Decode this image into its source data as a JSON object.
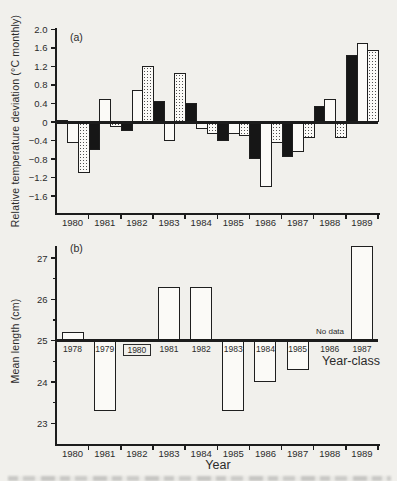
{
  "figure": {
    "panel_a_tag": "(a)",
    "panel_b_tag": "(b)",
    "paper_color": "#f1f0ec",
    "ink_color": "#1c1c1c"
  },
  "chart_data": [
    {
      "type": "bar",
      "panel": "a",
      "title": "",
      "ylabel": "Relative temperature deviation (°C monthly)",
      "xlabel": "",
      "ylim": [
        -2.05,
        2.05
      ],
      "grid": false,
      "ytick_values": [
        2.0,
        1.6,
        1.2,
        0.8,
        0.4,
        0,
        -0.4,
        -0.8,
        -1.2,
        -1.6
      ],
      "ytick_labels": [
        "2.0",
        "1.6",
        "1.2",
        "0.8",
        "0.4",
        "0",
        "−0.4",
        "−0.8",
        "−1.2",
        "−1.6"
      ],
      "categories": [
        "1980",
        "1981",
        "1982",
        "1983",
        "1984",
        "1985",
        "1986",
        "1987",
        "1988",
        "1989"
      ],
      "bar_order": "three contiguous bars per year, left to right: solid-black, open-white, stippled",
      "series": [
        {
          "name": "solid-black",
          "fill": "black",
          "values": [
            0.05,
            -0.6,
            -0.2,
            0.45,
            0.4,
            -0.4,
            -0.8,
            -0.75,
            0.35,
            1.45
          ]
        },
        {
          "name": "open-white",
          "fill": "white",
          "values": [
            -0.45,
            0.5,
            0.7,
            -0.4,
            -0.15,
            -0.25,
            -1.4,
            -0.65,
            0.5,
            1.7
          ]
        },
        {
          "name": "stippled",
          "fill": "stipple",
          "values": [
            -1.1,
            -0.1,
            1.2,
            1.05,
            -0.25,
            -0.3,
            -0.45,
            -0.35,
            -0.35,
            1.55
          ]
        }
      ]
    },
    {
      "type": "bar",
      "panel": "b",
      "title": "",
      "ylabel": "Mean length (cm)",
      "xlabel": "Year",
      "ylim": [
        22.5,
        27.6
      ],
      "baseline": 25,
      "grid": false,
      "ytick_values": [
        27,
        26,
        25,
        24,
        23
      ],
      "ytick_labels": [
        "27",
        "26",
        "25",
        "24",
        "23"
      ],
      "minor_ytick_values": [
        26.5,
        25.5,
        24.5,
        23.5
      ],
      "categories": [
        "1980",
        "1981",
        "1982",
        "1983",
        "1984",
        "1985",
        "1986",
        "1987",
        "1988",
        "1989"
      ],
      "year_class_title": "Year-class",
      "no_data_label": "No data",
      "bars": [
        {
          "year": "1980",
          "year_class": "1978",
          "mean_length_cm": 25.2
        },
        {
          "year": "1981",
          "year_class": "1979",
          "mean_length_cm": 23.3
        },
        {
          "year": "1982",
          "year_class": "1980",
          "mean_length_cm": null,
          "boxed_label": true
        },
        {
          "year": "1983",
          "year_class": "1981",
          "mean_length_cm": 26.3
        },
        {
          "year": "1984",
          "year_class": "1982",
          "mean_length_cm": 26.3
        },
        {
          "year": "1985",
          "year_class": "1983",
          "mean_length_cm": 23.3
        },
        {
          "year": "1986",
          "year_class": "1984",
          "mean_length_cm": 24.0
        },
        {
          "year": "1987",
          "year_class": "1985",
          "mean_length_cm": 24.3
        },
        {
          "year": "1988",
          "year_class": "1986",
          "mean_length_cm": null,
          "no_data": true
        },
        {
          "year": "1989",
          "year_class": "1987",
          "mean_length_cm": 27.3
        }
      ]
    }
  ]
}
